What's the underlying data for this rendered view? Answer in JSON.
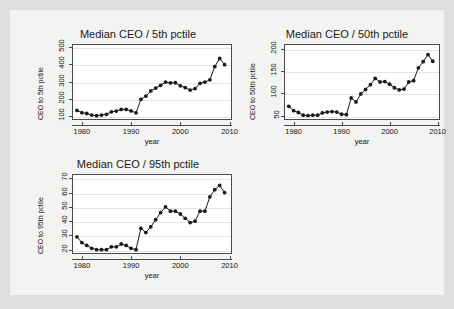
{
  "background": {
    "page_color": "#dededc",
    "panel_color": "#f3f3f1",
    "plot_color": "#ffffff",
    "marker_color": "#1a1a1a",
    "grid_color": "#e4e4e4"
  },
  "chart_data": [
    {
      "type": "line",
      "title": "Median CEO / 5th pctile",
      "xlabel": "year",
      "ylabel": "CEO to 5th pctile",
      "xlim": [
        1978,
        2010.5
      ],
      "ylim": [
        75,
        520
      ],
      "xticks": [
        1980,
        1990,
        2000,
        2010
      ],
      "yticks": [
        100,
        200,
        300,
        400,
        500
      ],
      "grid": true,
      "markers": true,
      "x": [
        1979,
        1980,
        1981,
        1982,
        1983,
        1984,
        1985,
        1986,
        1987,
        1988,
        1989,
        1990,
        1991,
        1992,
        1993,
        1994,
        1995,
        1996,
        1997,
        1998,
        1999,
        2000,
        2001,
        2002,
        2003,
        2004,
        2005,
        2006,
        2007,
        2008,
        2009
      ],
      "values": [
        131,
        118,
        113,
        104,
        100,
        104,
        108,
        123,
        127,
        137,
        137,
        128,
        117,
        196,
        215,
        245,
        262,
        278,
        297,
        292,
        293,
        275,
        265,
        250,
        259,
        290,
        297,
        310,
        388,
        435,
        399
      ]
    },
    {
      "type": "line",
      "title": "Median CEO / 50th pctile",
      "xlabel": "year",
      "ylabel": "CEO to 50th pctile",
      "xlim": [
        1978,
        2010.5
      ],
      "ylim": [
        40,
        212
      ],
      "xticks": [
        1980,
        1990,
        2000,
        2010
      ],
      "yticks": [
        50,
        100,
        150,
        200
      ],
      "grid": true,
      "markers": true,
      "x": [
        1979,
        1980,
        1981,
        1982,
        1983,
        1984,
        1985,
        1986,
        1987,
        1988,
        1989,
        1990,
        1991,
        1992,
        1993,
        1994,
        1995,
        1996,
        1997,
        1998,
        1999,
        2000,
        2001,
        2002,
        2003,
        2004,
        2005,
        2006,
        2007,
        2008,
        2009
      ],
      "values": [
        71,
        61,
        57,
        51,
        50,
        51,
        51,
        56,
        58,
        59,
        58,
        53,
        52,
        90,
        81,
        99,
        109,
        120,
        134,
        126,
        127,
        121,
        113,
        108,
        110,
        126,
        129,
        158,
        172,
        188,
        173
      ]
    },
    {
      "type": "line",
      "title": "Median CEO / 95th pctile",
      "xlabel": "year",
      "ylabel": "CEO to 95th pctile",
      "xlim": [
        1978,
        2010.5
      ],
      "ylim": [
        17,
        73
      ],
      "xticks": [
        1980,
        1990,
        2000,
        2010
      ],
      "yticks": [
        20,
        30,
        40,
        50,
        60,
        70
      ],
      "grid": true,
      "markers": true,
      "x": [
        1979,
        1980,
        1981,
        1982,
        1983,
        1984,
        1985,
        1986,
        1987,
        1988,
        1989,
        1990,
        1991,
        1992,
        1993,
        1994,
        1995,
        1996,
        1997,
        1998,
        1999,
        2000,
        2001,
        2002,
        2003,
        2004,
        2005,
        2006,
        2007,
        2008,
        2009
      ],
      "values": [
        29,
        25,
        23,
        21,
        20,
        20,
        20,
        22,
        22,
        24,
        23,
        21,
        20,
        35,
        32,
        36,
        41,
        46,
        50,
        47,
        47,
        45,
        42,
        39,
        40,
        47,
        47,
        57,
        62,
        65,
        60
      ]
    }
  ]
}
